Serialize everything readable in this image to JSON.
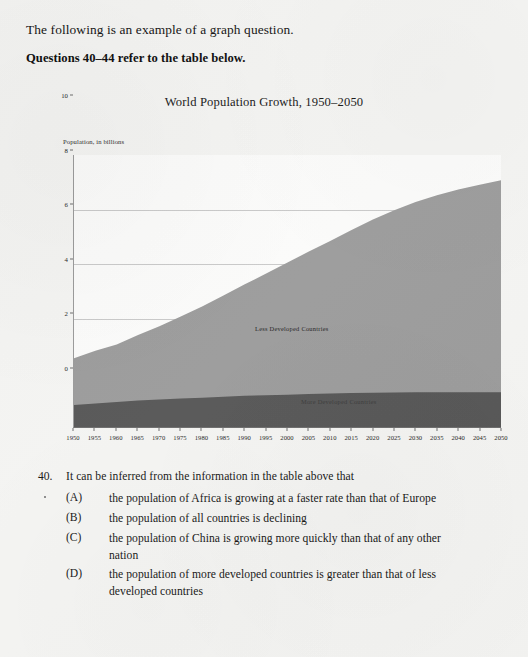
{
  "document": {
    "intro_line": "The following is an example of a graph question.",
    "questions_reference": "Questions 40–44 refer to the table below."
  },
  "chart_data": {
    "type": "area",
    "stacked": true,
    "title": "World Population Growth, 1950–2050",
    "xlabel": "",
    "ylabel": "Population, in billions",
    "ylim": [
      0,
      10
    ],
    "y_ticks": [
      "0",
      "2",
      "4",
      "6",
      "8",
      "10"
    ],
    "grid": true,
    "legend_position": "inside-series-labels",
    "x": [
      1950,
      1955,
      1960,
      1965,
      1970,
      1975,
      1980,
      1985,
      1990,
      1995,
      2000,
      2005,
      2010,
      2015,
      2020,
      2025,
      2030,
      2035,
      2040,
      2045,
      2050
    ],
    "categories": [
      "1950",
      "1955",
      "1960",
      "1965",
      "1970",
      "1975",
      "1980",
      "1985",
      "1990",
      "1995",
      "2000",
      "2005",
      "2010",
      "2015",
      "2020",
      "2025",
      "2030",
      "2035",
      "2040",
      "2045",
      "2050"
    ],
    "series": [
      {
        "name": "More Developed Countries",
        "color": "#565656",
        "values": [
          0.81,
          0.86,
          0.92,
          0.97,
          1.01,
          1.05,
          1.08,
          1.11,
          1.15,
          1.17,
          1.19,
          1.21,
          1.23,
          1.25,
          1.26,
          1.27,
          1.28,
          1.28,
          1.28,
          1.28,
          1.28
        ]
      },
      {
        "name": "Less Developed Countries",
        "color": "#9b9b9b",
        "values": [
          1.72,
          1.94,
          2.11,
          2.41,
          2.69,
          3.01,
          3.35,
          3.72,
          4.1,
          4.47,
          4.86,
          5.24,
          5.61,
          5.99,
          6.37,
          6.7,
          6.99,
          7.24,
          7.45,
          7.63,
          7.79
        ]
      }
    ],
    "totals": [
      2.53,
      2.8,
      3.03,
      3.38,
      3.7,
      4.06,
      4.43,
      4.83,
      5.25,
      5.64,
      6.05,
      6.45,
      6.84,
      7.24,
      7.63,
      7.97,
      8.27,
      8.52,
      8.73,
      8.91,
      9.07
    ]
  },
  "question": {
    "number": "40.",
    "stem": "It can be inferred from the information in the table above that",
    "choices": [
      {
        "letter": "(A)",
        "text": "the population of Africa is growing at a faster rate than that of Europe"
      },
      {
        "letter": "(B)",
        "text": "the population of all countries is declining"
      },
      {
        "letter": "(C)",
        "text": "the population of China is growing more quickly than that of any other nation"
      },
      {
        "letter": "(D)",
        "text": "the population of more developed countries is greater than that of less developed countries"
      }
    ]
  },
  "colors": {
    "page_background": "#f4f4f2",
    "plot_background": "#fbfbfa",
    "less_developed": "#9b9b9b",
    "more_developed": "#565656",
    "gridline": "#c9c9c9",
    "axis": "#6d6d6d",
    "text": "#141414"
  }
}
